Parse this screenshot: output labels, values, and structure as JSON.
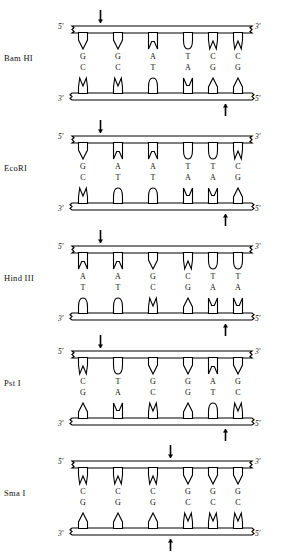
{
  "figure": {
    "panel_count": 5,
    "strand_labels": {
      "top_left": "5'",
      "top_right": "3'",
      "bottom_left": "3'",
      "bottom_right": "5'"
    },
    "colors": {
      "ink": "#000000",
      "background": "#ffffff"
    }
  },
  "panels": [
    {
      "enzyme": "Bam HI",
      "top_sequence": [
        "G",
        "G",
        "A",
        "T",
        "C",
        "C"
      ],
      "bottom_sequence": [
        "C",
        "C",
        "T",
        "A",
        "G",
        "G"
      ],
      "top_cut_after": 1,
      "bottom_cut_after": 5,
      "arrows": {
        "top": {
          "direction": "down",
          "index": 1
        },
        "bottom": {
          "direction": "up",
          "index": 5
        }
      }
    },
    {
      "enzyme": "EcoRI",
      "top_sequence": [
        "G",
        "A",
        "A",
        "T",
        "T",
        "C"
      ],
      "bottom_sequence": [
        "C",
        "T",
        "T",
        "A",
        "A",
        "G"
      ],
      "top_cut_after": 1,
      "bottom_cut_after": 5,
      "arrows": {
        "top": {
          "direction": "down",
          "index": 1
        },
        "bottom": {
          "direction": "up",
          "index": 5
        }
      }
    },
    {
      "enzyme": "Hind III",
      "top_sequence": [
        "A",
        "A",
        "G",
        "C",
        "T",
        "T"
      ],
      "bottom_sequence": [
        "T",
        "T",
        "C",
        "G",
        "A",
        "A"
      ],
      "top_cut_after": 1,
      "bottom_cut_after": 5,
      "arrows": {
        "top": {
          "direction": "down",
          "index": 1
        },
        "bottom": {
          "direction": "up",
          "index": 5
        }
      }
    },
    {
      "enzyme": "Pst I",
      "top_sequence": [
        "C",
        "T",
        "G",
        "G",
        "A",
        "G"
      ],
      "bottom_sequence": [
        "G",
        "A",
        "C",
        "G",
        "T",
        "C"
      ],
      "top_cut_after": 1,
      "bottom_cut_after": 5,
      "arrows": {
        "top": {
          "direction": "down",
          "index": 1
        },
        "bottom": {
          "direction": "up",
          "index": 5
        }
      }
    },
    {
      "enzyme": "Sma I",
      "top_sequence": [
        "C",
        "C",
        "C",
        "G",
        "G",
        "G"
      ],
      "bottom_sequence": [
        "G",
        "G",
        "G",
        "C",
        "C",
        "C"
      ],
      "top_cut_after": 3,
      "bottom_cut_after": 3,
      "arrows": {
        "top": {
          "direction": "down",
          "index": 3
        },
        "bottom": {
          "direction": "up",
          "index": 3
        }
      }
    }
  ],
  "geometry": {
    "rung_x": [
      83,
      118,
      153,
      188,
      213,
      238
    ],
    "panel_tops": [
      8,
      118,
      228,
      333,
      443
    ]
  }
}
